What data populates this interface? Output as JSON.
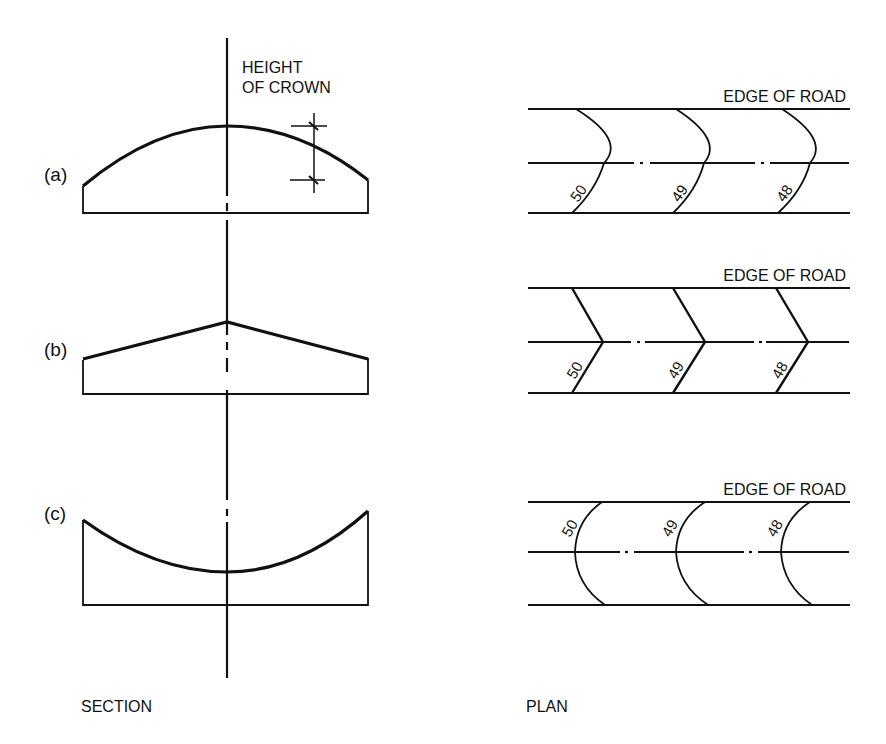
{
  "diagram": {
    "colors": {
      "ink": "#111111",
      "background": "#ffffff"
    },
    "section": {
      "caption": "SECTION",
      "height_of_crown_label_line1": "HEIGHT",
      "height_of_crown_label_line2": "OF CROWN",
      "cases": [
        {
          "id": "a",
          "label": "(a)",
          "profile": "convex-parabolic-crown"
        },
        {
          "id": "b",
          "label": "(b)",
          "profile": "straight-line-crown"
        },
        {
          "id": "c",
          "label": "(c)",
          "profile": "concave-dished"
        }
      ]
    },
    "plan": {
      "caption": "PLAN",
      "edge_label": "EDGE OF ROAD",
      "cases": [
        {
          "id": "a",
          "edge_label": "EDGE OF ROAD",
          "contours": [
            "50",
            "49",
            "48"
          ],
          "shape": "curved-convex"
        },
        {
          "id": "b",
          "edge_label": "EDGE OF ROAD",
          "contours": [
            "50",
            "49",
            "48"
          ],
          "shape": "chevron"
        },
        {
          "id": "c",
          "edge_label": "EDGE OF ROAD",
          "contours": [
            "50",
            "49",
            "48"
          ],
          "shape": "curved-concave"
        }
      ]
    }
  }
}
